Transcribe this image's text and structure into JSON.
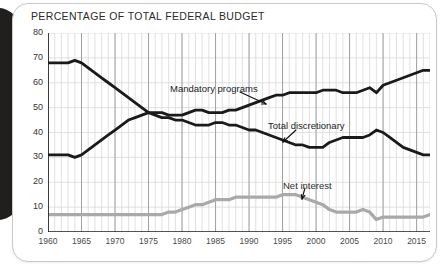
{
  "figure": {
    "title": "PERCENTAGE OF TOTAL FEDERAL BUDGET"
  },
  "colors": {
    "mandatory": "#1a1a1a",
    "discretionary": "#1a1a1a",
    "net_interest": "#a9a9a9",
    "grid_minor": "#d8d8d8",
    "grid_major": "#9a9a9a",
    "axis": "#1a1a1a",
    "card_border": "#c9c9c9",
    "spine": "#211f1e",
    "title_text": "#2b2b2b"
  },
  "annotations": {
    "mandatory": {
      "label": "Mandatory programs",
      "x_px": 170,
      "y_px": 83
    },
    "discretionary": {
      "label": "Total discretionary",
      "x_px": 268,
      "y_px": 120
    },
    "net_interest": {
      "label": "Net interest",
      "x_px": 283,
      "y_px": 180
    }
  },
  "chart_data": {
    "type": "line",
    "title": "PERCENTAGE OF TOTAL FEDERAL BUDGET",
    "xlabel": "",
    "ylabel": "",
    "xlim": [
      1960,
      2017
    ],
    "ylim": [
      0,
      80
    ],
    "yticks": [
      0,
      10,
      20,
      30,
      40,
      50,
      60,
      70,
      80
    ],
    "xticks": [
      1960,
      1965,
      1970,
      1975,
      1980,
      1985,
      1990,
      1995,
      2000,
      2005,
      2010,
      2015
    ],
    "grid": "minor vertical every year, major vertical every 5 years, horizontal at each 10",
    "legend": "inline annotations with leader arrows",
    "x": [
      1960,
      1961,
      1962,
      1963,
      1964,
      1965,
      1966,
      1967,
      1968,
      1969,
      1970,
      1971,
      1972,
      1973,
      1974,
      1975,
      1976,
      1977,
      1978,
      1979,
      1980,
      1981,
      1982,
      1983,
      1984,
      1985,
      1986,
      1987,
      1988,
      1989,
      1990,
      1991,
      1992,
      1993,
      1994,
      1995,
      1996,
      1997,
      1998,
      1999,
      2000,
      2001,
      2002,
      2003,
      2004,
      2005,
      2006,
      2007,
      2008,
      2009,
      2010,
      2011,
      2012,
      2013,
      2014,
      2015,
      2016,
      2017
    ],
    "series": [
      {
        "name": "Total discretionary",
        "color": "#1a1a1a",
        "values": [
          68,
          68,
          68,
          68,
          69,
          68,
          66,
          64,
          62,
          60,
          58,
          56,
          54,
          52,
          50,
          48,
          47,
          46,
          46,
          45,
          45,
          44,
          43,
          43,
          43,
          44,
          44,
          43,
          43,
          42,
          41,
          41,
          40,
          39,
          38,
          37,
          36,
          35,
          35,
          34,
          34,
          34,
          36,
          37,
          38,
          38,
          38,
          38,
          39,
          41,
          40,
          38,
          36,
          34,
          33,
          32,
          31,
          31
        ]
      },
      {
        "name": "Mandatory programs",
        "color": "#1a1a1a",
        "values": [
          31,
          31,
          31,
          31,
          30,
          31,
          33,
          35,
          37,
          39,
          41,
          43,
          45,
          46,
          47,
          48,
          48,
          48,
          47,
          47,
          47,
          48,
          49,
          49,
          48,
          48,
          48,
          49,
          49,
          50,
          51,
          52,
          53,
          54,
          55,
          55,
          56,
          56,
          56,
          56,
          56,
          57,
          57,
          57,
          56,
          56,
          56,
          57,
          58,
          56,
          59,
          60,
          61,
          62,
          63,
          64,
          65,
          65
        ]
      },
      {
        "name": "Net interest",
        "color": "#a9a9a9",
        "values": [
          7,
          7,
          7,
          7,
          7,
          7,
          7,
          7,
          7,
          7,
          7,
          7,
          7,
          7,
          7,
          7,
          7,
          7,
          8,
          8,
          9,
          10,
          11,
          11,
          12,
          13,
          13,
          13,
          14,
          14,
          14,
          14,
          14,
          14,
          14,
          15,
          15,
          15,
          14,
          13,
          12,
          11,
          9,
          8,
          8,
          8,
          8,
          9,
          8,
          5,
          6,
          6,
          6,
          6,
          6,
          6,
          6,
          7
        ]
      }
    ]
  }
}
